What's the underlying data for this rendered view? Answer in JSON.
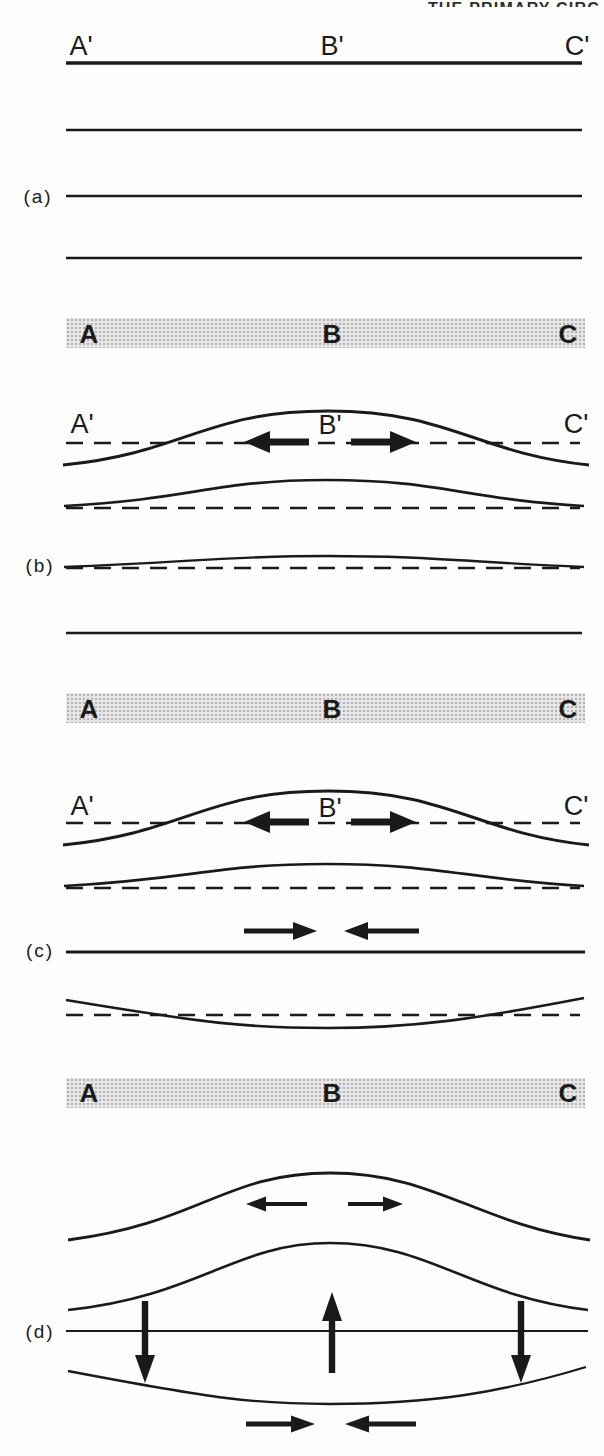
{
  "page": {
    "running_header_fragment": "THE PRIMARY CIRC"
  },
  "panel_a": {
    "tag": "(a)",
    "labels": {
      "left": "A'",
      "center": "B'",
      "right": "C'"
    },
    "band": {
      "left": "A",
      "center": "B",
      "right": "C"
    }
  },
  "panel_b": {
    "tag": "(b)",
    "labels": {
      "left": "A'",
      "center": "B'",
      "right": "C'"
    },
    "band": {
      "left": "A",
      "center": "B",
      "right": "C"
    }
  },
  "panel_c": {
    "tag": "(c)",
    "labels": {
      "left": "A'",
      "center": "B'",
      "right": "C'"
    }
  },
  "panel_c_band": {
    "left": "A",
    "center": "B",
    "right": "C"
  },
  "panel_d": {
    "tag": "(d)"
  },
  "icons": {
    "diverging_arrows": "horizontal arrows pointing outward from fold crest (extension)",
    "converging_arrows": "horizontal arrows pointing inward (compression)",
    "up_arrow": "vertical arrow pointing up at fold axis (uplift)",
    "down_arrows": "vertical arrows pointing down on limbs (subsidence)"
  },
  "colors": {
    "ink": "#1a1a1a",
    "paper": "#fdfdfd",
    "band_fill": "#e6e6e6",
    "band_dot": "#b0b0b0"
  }
}
